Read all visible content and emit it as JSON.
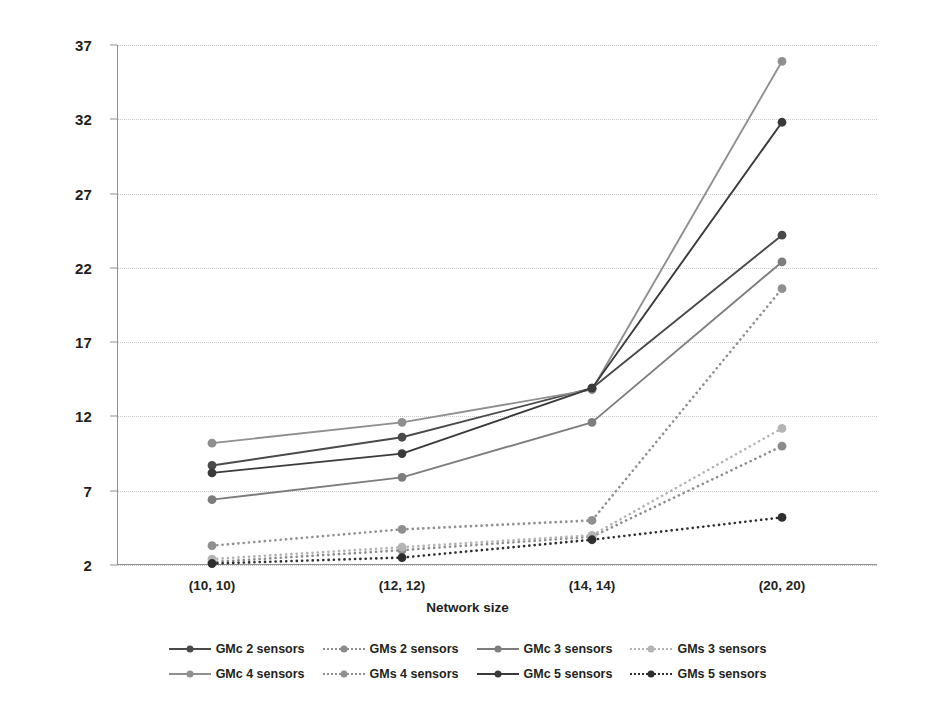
{
  "chart_data": {
    "type": "line",
    "title": "",
    "xlabel": "Network size",
    "ylabel": "",
    "categories": [
      "(10, 10)",
      "(12, 12)",
      "(14, 14)",
      "(20, 20)"
    ],
    "yticks": [
      2,
      7,
      12,
      17,
      22,
      27,
      32,
      37
    ],
    "ylim": [
      2,
      37
    ],
    "grid": true,
    "legend_position": "bottom",
    "series": [
      {
        "name": "GMc 2 sensors",
        "values": [
          8.7,
          10.6,
          13.9,
          24.2
        ],
        "style": "solid",
        "color": "#4a4a4a",
        "marker": "circle"
      },
      {
        "name": "GMs 2 sensors",
        "values": [
          2.2,
          3.0,
          3.9,
          10.0
        ],
        "style": "dotted",
        "color": "#8c8c8c",
        "marker": "circle"
      },
      {
        "name": "GMc 3 sensors",
        "values": [
          6.4,
          7.9,
          11.6,
          22.4
        ],
        "style": "solid",
        "color": "#7d7d7d",
        "marker": "circle"
      },
      {
        "name": "GMs 3 sensors",
        "values": [
          2.4,
          3.2,
          4.0,
          11.2
        ],
        "style": "dotted",
        "color": "#b4b4b4",
        "marker": "circle"
      },
      {
        "name": "GMc 4 sensors",
        "values": [
          10.2,
          11.6,
          13.8,
          35.9
        ],
        "style": "solid",
        "color": "#8f8f8f",
        "marker": "circle"
      },
      {
        "name": "GMs 4 sensors",
        "values": [
          3.3,
          4.4,
          5.0,
          20.6
        ],
        "style": "dotted",
        "color": "#909090",
        "marker": "circle"
      },
      {
        "name": "GMc 5 sensors",
        "values": [
          8.2,
          9.5,
          13.9,
          31.8
        ],
        "style": "solid",
        "color": "#3a3a3a",
        "marker": "circle"
      },
      {
        "name": "GMs 5 sensors",
        "values": [
          2.1,
          2.5,
          3.7,
          5.2
        ],
        "style": "dotted",
        "color": "#2e2e2e",
        "marker": "circle"
      }
    ]
  },
  "axis": {
    "x_title": "Network size"
  },
  "legend": {
    "rows": [
      [
        "GMc 2 sensors",
        "GMs 2 sensors",
        "GMc 3 sensors",
        "GMs 3 sensors"
      ],
      [
        "GMc 4 sensors",
        "GMs 4 sensors",
        "GMc 5 sensors",
        "GMs 5 sensors"
      ]
    ]
  },
  "colors": {
    "gridline": "#c9c9c9",
    "axis": "#8f8f8f",
    "text": "#231f20",
    "background": "#ffffff"
  }
}
